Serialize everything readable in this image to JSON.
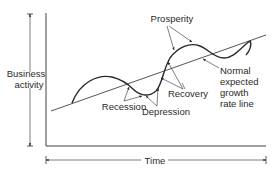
{
  "diagram": {
    "y_axis_label_line1": "Business",
    "y_axis_label_line2": "activity",
    "x_axis_label": "Time",
    "labels": {
      "prosperity": "Prosperity",
      "recession": "Recession",
      "depression": "Depression",
      "recovery": "Recovery",
      "trend_line1": "Normal",
      "trend_line2": "expected",
      "trend_line3": "growth",
      "trend_line4": "rate line"
    },
    "colors": {
      "ink": "#2a2a2a",
      "background": "#ffffff"
    }
  }
}
